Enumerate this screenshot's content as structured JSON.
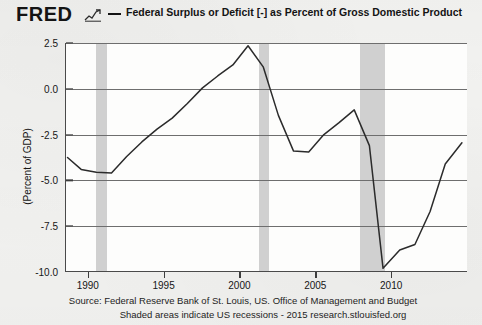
{
  "header": {
    "logo_text": "FRED",
    "logo_mark_icon": "line-chart-icon",
    "legend_dash_icon": "legend-dash-icon",
    "series_title": "Federal Surplus or Deficit [-] as Percent of Gross Domestic Product"
  },
  "footer": {
    "line1": "Source: Federal Reserve Bank of St. Louis, US. Office of Management and Budget",
    "line2": "Shaded areas indicate US recessions - 2015 research.stlouisfed.org"
  },
  "colors": {
    "page_background": "#f2f2f0",
    "plot_background": "#fdfdfc",
    "series_line": "#2b2b2b",
    "gridline": "#6e6e6e",
    "axis": "#4a4a4a",
    "recession_band": "#c9c9c9",
    "text": "#161616"
  },
  "chart_data": {
    "type": "line",
    "title": "Federal Surplus or Deficit [-] as Percent of Gross Domestic Product",
    "subtitle": "",
    "xlabel": "",
    "ylabel": "(Percent of GDP)",
    "xlim": [
      1988.5,
      2015.0
    ],
    "ylim": [
      -10.0,
      2.5
    ],
    "grid": true,
    "legend_position": "top",
    "y_ticks": [
      2.5,
      0.0,
      -2.5,
      -5.0,
      -7.5,
      -10.0
    ],
    "y_tick_labels": [
      "2.5",
      "0.0",
      "-2.5",
      "-5.0",
      "-7.5",
      "-10.0"
    ],
    "x_ticks": [
      1990,
      1995,
      2000,
      2005,
      2010
    ],
    "x_tick_labels": [
      "1990",
      "1995",
      "2000",
      "2005",
      "2010"
    ],
    "series": [
      {
        "name": "Federal Surplus or Deficit [-] as Percent of Gross Domestic Product",
        "color": "#2b2b2b",
        "x": [
          1988.6,
          1989.5,
          1990.5,
          1991.5,
          1992.5,
          1993.5,
          1994.5,
          1995.5,
          1996.5,
          1997.5,
          1998.5,
          1999.5,
          2000.5,
          2001.5,
          2002.5,
          2003.5,
          2004.5,
          2005.5,
          2006.5,
          2007.5,
          2008.5,
          2009.4,
          2010.5,
          2011.5,
          2012.5,
          2013.5,
          2014.6
        ],
        "values": [
          -3.75,
          -4.4,
          -4.55,
          -4.6,
          -3.7,
          -2.9,
          -2.2,
          -1.6,
          -0.8,
          0.05,
          0.7,
          1.3,
          2.35,
          1.2,
          -1.45,
          -3.4,
          -3.45,
          -2.5,
          -1.85,
          -1.15,
          -3.1,
          -9.8,
          -8.8,
          -8.5,
          -6.7,
          -4.1,
          -2.95
        ]
      }
    ],
    "recessions": [
      {
        "label": "1990-1991 recession",
        "start": 1990.5,
        "end": 1991.2
      },
      {
        "label": "2001 recession",
        "start": 2001.2,
        "end": 2001.9
      },
      {
        "label": "2007-2009 recession",
        "start": 2007.9,
        "end": 2009.5
      }
    ],
    "annotations": [
      "Shaded areas indicate US recessions"
    ]
  }
}
